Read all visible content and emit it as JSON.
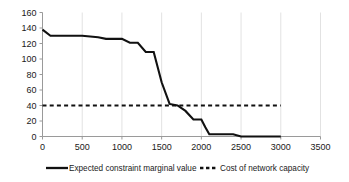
{
  "chart_data": {
    "type": "line",
    "title": "",
    "xlabel": "",
    "ylabel": "",
    "xlim": [
      0,
      3500
    ],
    "ylim": [
      0,
      160
    ],
    "xticks": [
      0,
      500,
      1000,
      1500,
      2000,
      2500,
      3000,
      3500
    ],
    "yticks": [
      0,
      20,
      40,
      60,
      80,
      100,
      120,
      140,
      160
    ],
    "grid": "vertical-only",
    "legend_position": "bottom-center",
    "series": [
      {
        "name": "Expected constraint marginal value",
        "style": "solid",
        "color": "#111111",
        "x": [
          0,
          100,
          500,
          700,
          800,
          1000,
          1100,
          1200,
          1300,
          1400,
          1500,
          1600,
          1650,
          1700,
          1800,
          1900,
          2000,
          2050,
          2100,
          2400,
          2500,
          3000
        ],
        "y": [
          138,
          130,
          130,
          128,
          126,
          126,
          121,
          121,
          109,
          109,
          70,
          42,
          41,
          40,
          33,
          22,
          22,
          12,
          3,
          3,
          0,
          0
        ]
      },
      {
        "name": "Cost of network capacity",
        "style": "dashed",
        "color": "#111111",
        "x": [
          0,
          3000
        ],
        "y": [
          40,
          40
        ]
      }
    ]
  },
  "legend": {
    "items": [
      {
        "label": "Expected constraint marginal value",
        "marker": "solid-line-swatch"
      },
      {
        "label": "Cost of network capacity",
        "marker": "dashed-line-swatch"
      }
    ]
  },
  "colors": {
    "line": "#111111",
    "axis": "#9a9a9a",
    "gridline": "#e2e2e2",
    "text": "#1a1a1a",
    "background": "#ffffff"
  }
}
